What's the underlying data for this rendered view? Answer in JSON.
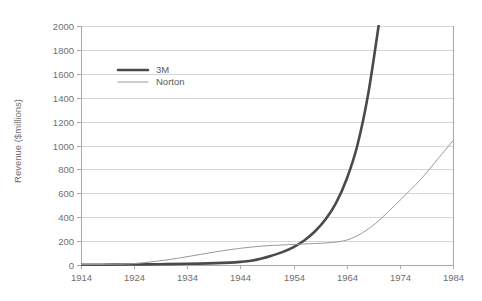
{
  "chart_data": {
    "type": "line",
    "title": "",
    "xlabel": "",
    "ylabel": "Revenue ($millions)",
    "xlim": [
      1914,
      1984
    ],
    "ylim": [
      0,
      2000
    ],
    "grid": true,
    "legend_position": "top-left-inside",
    "x_ticks": [
      "1914",
      "1924",
      "1934",
      "1944",
      "1954",
      "1964",
      "1974",
      "1984"
    ],
    "y_ticks": [
      "0",
      "200",
      "400",
      "600",
      "800",
      "1000",
      "1200",
      "1400",
      "1600",
      "1800",
      "2000"
    ],
    "series": [
      {
        "name": "3M",
        "color": "#4a4a4a",
        "width": 2.6,
        "x": [
          1914,
          1920,
          1926,
          1930,
          1934,
          1938,
          1942,
          1944,
          1946,
          1948,
          1950,
          1952,
          1954,
          1956,
          1958,
          1960,
          1962,
          1964,
          1966,
          1968,
          1970
        ],
        "values": [
          2,
          3,
          5,
          7,
          10,
          14,
          20,
          26,
          36,
          55,
          80,
          110,
          150,
          205,
          280,
          380,
          520,
          720,
          1000,
          1420,
          2000
        ]
      },
      {
        "name": "Norton",
        "color": "#9a9a9a",
        "width": 1.0,
        "x": [
          1914,
          1920,
          1924,
          1928,
          1932,
          1936,
          1940,
          1944,
          1948,
          1952,
          1956,
          1960,
          1962,
          1964,
          1966,
          1968,
          1970,
          1974,
          1978,
          1981,
          1984
        ],
        "values": [
          3,
          6,
          12,
          30,
          55,
          85,
          115,
          140,
          158,
          168,
          176,
          184,
          192,
          208,
          245,
          300,
          370,
          540,
          720,
          880,
          1040
        ]
      }
    ]
  },
  "legend": {
    "items": [
      {
        "label": "3M"
      },
      {
        "label": "Norton"
      }
    ]
  },
  "colors": {
    "series_3m": "#4a4a4a",
    "series_norton": "#9a9a9a",
    "gridline": "#d6d6d6",
    "axis": "#a9a9a9",
    "text": "#6f6f6f",
    "background": "#ffffff"
  }
}
